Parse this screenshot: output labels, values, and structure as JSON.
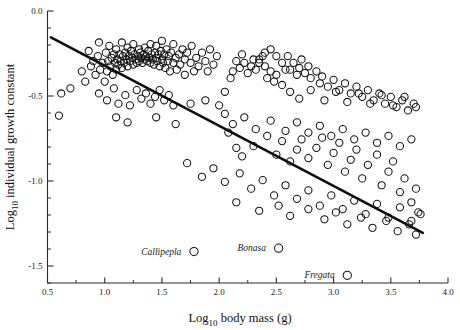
{
  "chart_data": {
    "type": "scatter",
    "title": "",
    "xlabel": "Log10 body mass (g)",
    "xlabel_main": "Log",
    "xlabel_sub": "10",
    "xlabel_rest": " body mass (g)",
    "ylabel": "Log10 individual growth constant",
    "ylabel_main": "Log",
    "ylabel_sub": "10",
    "ylabel_rest": " individual growth constant",
    "xlim": [
      0.5,
      4.0
    ],
    "ylim": [
      -1.6,
      0.0
    ],
    "grid": false,
    "legend": "none",
    "xticks": [
      0.5,
      1.0,
      1.5,
      2.0,
      2.5,
      3.0,
      3.5,
      4.0
    ],
    "xtick_labels": [
      "0.5",
      "1.0",
      "1.5",
      "2.0",
      "2.5",
      "3.0",
      "3.5",
      "4.0"
    ],
    "xminor_step": 0.25,
    "yticks": [
      0.0,
      -0.5,
      -1.0,
      -1.5
    ],
    "ytick_labels": [
      "0.0",
      "-0.5",
      "-1.0",
      "-1.5"
    ],
    "yminor_step": 0.1,
    "marker": "open-circle",
    "marker_radius_px": 3.6,
    "point_color": "#131313",
    "line_color": "#0d0d0d",
    "regression_line": {
      "x_start": 0.53,
      "y_start": -0.155,
      "x_end": 3.78,
      "y_end": -1.305,
      "slope": -0.354,
      "intercept": 0.033
    },
    "annotations": [
      {
        "label": "Callipepla",
        "x": 1.78,
        "y": -1.415,
        "label_dx_px": -6,
        "label_dy_px": 3
      },
      {
        "label": "Bonasa",
        "x": 2.52,
        "y": -1.395,
        "label_dx_px": -6,
        "label_dy_px": 3
      },
      {
        "label": "Fregata",
        "x": 3.12,
        "y": -1.555,
        "label_dx_px": -6,
        "label_dy_px": 3
      }
    ],
    "points": [
      [
        0.6,
        -0.615
      ],
      [
        0.62,
        -0.485
      ],
      [
        0.7,
        -0.455
      ],
      [
        0.8,
        -0.355
      ],
      [
        0.83,
        -0.415
      ],
      [
        0.86,
        -0.235
      ],
      [
        0.88,
        -0.325
      ],
      [
        0.9,
        -0.295
      ],
      [
        0.92,
        -0.375
      ],
      [
        0.94,
        -0.265
      ],
      [
        0.95,
        -0.185
      ],
      [
        0.96,
        -0.345
      ],
      [
        0.98,
        -0.305
      ],
      [
        1.0,
        -0.415
      ],
      [
        1.01,
        -0.245
      ],
      [
        1.02,
        -0.355
      ],
      [
        1.03,
        -0.295
      ],
      [
        1.04,
        -0.205
      ],
      [
        1.05,
        -0.325
      ],
      [
        1.06,
        -0.275
      ],
      [
        1.07,
        -0.375
      ],
      [
        1.08,
        -0.255
      ],
      [
        1.09,
        -0.305
      ],
      [
        1.1,
        -0.225
      ],
      [
        1.1,
        -0.345
      ],
      [
        1.11,
        -0.285
      ],
      [
        1.12,
        -0.315
      ],
      [
        1.13,
        -0.255
      ],
      [
        1.14,
        -0.295
      ],
      [
        1.15,
        -0.335
      ],
      [
        1.15,
        -0.185
      ],
      [
        1.16,
        -0.265
      ],
      [
        1.17,
        -0.305
      ],
      [
        1.18,
        -0.245
      ],
      [
        1.19,
        -0.285
      ],
      [
        1.2,
        -0.325
      ],
      [
        1.2,
        -0.215
      ],
      [
        1.21,
        -0.265
      ],
      [
        1.22,
        -0.295
      ],
      [
        1.23,
        -0.235
      ],
      [
        1.24,
        -0.275
      ],
      [
        1.25,
        -0.315
      ],
      [
        1.25,
        -0.195
      ],
      [
        1.26,
        -0.255
      ],
      [
        1.27,
        -0.285
      ],
      [
        1.28,
        -0.305
      ],
      [
        1.29,
        -0.265
      ],
      [
        1.3,
        -0.225
      ],
      [
        1.3,
        -0.295
      ],
      [
        1.31,
        -0.245
      ],
      [
        1.32,
        -0.275
      ],
      [
        1.33,
        -0.305
      ],
      [
        1.34,
        -0.255
      ],
      [
        1.35,
        -0.285
      ],
      [
        1.35,
        -0.215
      ],
      [
        1.36,
        -0.265
      ],
      [
        1.37,
        -0.295
      ],
      [
        1.38,
        -0.235
      ],
      [
        1.39,
        -0.275
      ],
      [
        1.4,
        -0.305
      ],
      [
        1.4,
        -0.195
      ],
      [
        1.41,
        -0.255
      ],
      [
        1.42,
        -0.285
      ],
      [
        1.43,
        -0.315
      ],
      [
        1.44,
        -0.245
      ],
      [
        1.45,
        -0.275
      ],
      [
        1.45,
        -0.205
      ],
      [
        1.46,
        -0.295
      ],
      [
        1.47,
        -0.255
      ],
      [
        1.48,
        -0.325
      ],
      [
        1.49,
        -0.235
      ],
      [
        1.5,
        -0.285
      ],
      [
        1.5,
        -0.175
      ],
      [
        1.51,
        -0.305
      ],
      [
        1.52,
        -0.255
      ],
      [
        1.53,
        -0.335
      ],
      [
        1.54,
        -0.225
      ],
      [
        1.55,
        -0.295
      ],
      [
        1.56,
        -0.265
      ],
      [
        1.57,
        -0.355
      ],
      [
        1.58,
        -0.245
      ],
      [
        1.6,
        -0.305
      ],
      [
        1.6,
        -0.195
      ],
      [
        1.62,
        -0.275
      ],
      [
        1.63,
        -0.345
      ],
      [
        1.65,
        -0.255
      ],
      [
        1.66,
        -0.315
      ],
      [
        1.68,
        -0.225
      ],
      [
        1.7,
        -0.285
      ],
      [
        1.7,
        -0.375
      ],
      [
        1.72,
        -0.245
      ],
      [
        1.75,
        -0.305
      ],
      [
        1.76,
        -0.205
      ],
      [
        1.78,
        -0.355
      ],
      [
        1.8,
        -0.275
      ],
      [
        1.82,
        -0.325
      ],
      [
        1.85,
        -0.245
      ],
      [
        1.88,
        -0.295
      ],
      [
        1.9,
        -0.355
      ],
      [
        1.92,
        -0.225
      ],
      [
        1.95,
        -0.315
      ],
      [
        1.98,
        -0.265
      ],
      [
        0.95,
        -0.485
      ],
      [
        1.02,
        -0.525
      ],
      [
        1.08,
        -0.455
      ],
      [
        1.12,
        -0.545
      ],
      [
        1.18,
        -0.495
      ],
      [
        1.22,
        -0.555
      ],
      [
        1.28,
        -0.465
      ],
      [
        1.32,
        -0.515
      ],
      [
        1.36,
        -0.485
      ],
      [
        1.4,
        -0.545
      ],
      [
        1.44,
        -0.505
      ],
      [
        1.48,
        -0.465
      ],
      [
        1.52,
        -0.525
      ],
      [
        1.56,
        -0.495
      ],
      [
        1.6,
        -0.555
      ],
      [
        1.1,
        -0.625
      ],
      [
        1.2,
        -0.655
      ],
      [
        1.45,
        -0.625
      ],
      [
        1.62,
        -0.665
      ],
      [
        1.75,
        -0.545
      ],
      [
        1.88,
        -0.525
      ],
      [
        2.0,
        -0.555
      ],
      [
        2.05,
        -0.475
      ],
      [
        2.1,
        -0.395
      ],
      [
        2.12,
        -0.355
      ],
      [
        2.15,
        -0.295
      ],
      [
        2.18,
        -0.335
      ],
      [
        2.2,
        -0.255
      ],
      [
        2.22,
        -0.305
      ],
      [
        2.25,
        -0.365
      ],
      [
        2.28,
        -0.325
      ],
      [
        2.3,
        -0.285
      ],
      [
        2.32,
        -0.345
      ],
      [
        2.35,
        -0.305
      ],
      [
        2.38,
        -0.265
      ],
      [
        2.4,
        -0.325
      ],
      [
        2.42,
        -0.395
      ],
      [
        2.45,
        -0.355
      ],
      [
        2.48,
        -0.415
      ],
      [
        2.5,
        -0.375
      ],
      [
        2.55,
        -0.435
      ],
      [
        2.58,
        -0.345
      ],
      [
        2.35,
        -0.285
      ],
      [
        2.4,
        -0.245
      ],
      [
        2.45,
        -0.225
      ],
      [
        2.5,
        -0.265
      ],
      [
        2.55,
        -0.305
      ],
      [
        2.6,
        -0.265
      ],
      [
        2.62,
        -0.345
      ],
      [
        2.65,
        -0.305
      ],
      [
        2.68,
        -0.375
      ],
      [
        2.7,
        -0.335
      ],
      [
        2.72,
        -0.285
      ],
      [
        2.75,
        -0.365
      ],
      [
        2.78,
        -0.325
      ],
      [
        2.8,
        -0.395
      ],
      [
        2.85,
        -0.355
      ],
      [
        2.88,
        -0.425
      ],
      [
        2.9,
        -0.385
      ],
      [
        2.95,
        -0.445
      ],
      [
        3.0,
        -0.405
      ],
      [
        3.05,
        -0.465
      ],
      [
        3.1,
        -0.425
      ],
      [
        3.15,
        -0.485
      ],
      [
        3.2,
        -0.445
      ],
      [
        3.25,
        -0.505
      ],
      [
        3.3,
        -0.465
      ],
      [
        3.35,
        -0.525
      ],
      [
        3.4,
        -0.485
      ],
      [
        3.45,
        -0.545
      ],
      [
        3.5,
        -0.505
      ],
      [
        3.55,
        -0.565
      ],
      [
        3.6,
        -0.525
      ],
      [
        3.65,
        -0.585
      ],
      [
        3.7,
        -0.545
      ],
      [
        2.08,
        -0.715
      ],
      [
        2.15,
        -0.805
      ],
      [
        2.2,
        -0.855
      ],
      [
        2.3,
        -0.795
      ],
      [
        2.42,
        -0.735
      ],
      [
        2.5,
        -0.845
      ],
      [
        2.55,
        -0.765
      ],
      [
        2.62,
        -0.885
      ],
      [
        2.68,
        -0.815
      ],
      [
        2.72,
        -0.755
      ],
      [
        2.78,
        -0.865
      ],
      [
        2.85,
        -0.805
      ],
      [
        2.9,
        -0.745
      ],
      [
        2.95,
        -0.905
      ],
      [
        3.0,
        -0.835
      ],
      [
        3.05,
        -0.775
      ],
      [
        3.1,
        -0.945
      ],
      [
        3.15,
        -0.875
      ],
      [
        3.2,
        -0.815
      ],
      [
        3.25,
        -0.985
      ],
      [
        3.3,
        -0.905
      ],
      [
        3.38,
        -0.845
      ],
      [
        3.42,
        -1.025
      ],
      [
        3.48,
        -0.945
      ],
      [
        3.52,
        -0.885
      ],
      [
        3.58,
        -1.065
      ],
      [
        3.62,
        -0.985
      ],
      [
        3.68,
        -1.125
      ],
      [
        3.72,
        -1.045
      ],
      [
        3.76,
        -1.195
      ],
      [
        1.72,
        -0.895
      ],
      [
        1.85,
        -0.975
      ],
      [
        1.95,
        -0.925
      ],
      [
        2.05,
        -1.005
      ],
      [
        2.18,
        -0.955
      ],
      [
        2.28,
        -1.045
      ],
      [
        2.38,
        -0.995
      ],
      [
        2.48,
        -1.085
      ],
      [
        2.58,
        -1.025
      ],
      [
        2.68,
        -1.105
      ],
      [
        2.78,
        -1.055
      ],
      [
        2.88,
        -1.145
      ],
      [
        2.98,
        -1.085
      ],
      [
        3.08,
        -1.165
      ],
      [
        3.18,
        -1.115
      ],
      [
        3.28,
        -1.195
      ],
      [
        3.38,
        -1.135
      ],
      [
        3.48,
        -1.215
      ],
      [
        3.58,
        -1.155
      ],
      [
        3.68,
        -1.235
      ],
      [
        3.74,
        -1.185
      ],
      [
        2.15,
        -1.125
      ],
      [
        2.35,
        -1.175
      ],
      [
        2.52,
        -1.145
      ],
      [
        2.62,
        -1.205
      ],
      [
        2.78,
        -1.165
      ],
      [
        2.92,
        -1.225
      ],
      [
        3.02,
        -1.185
      ],
      [
        3.12,
        -1.255
      ],
      [
        3.24,
        -1.215
      ],
      [
        3.34,
        -1.275
      ],
      [
        3.46,
        -1.235
      ],
      [
        3.56,
        -1.295
      ],
      [
        3.66,
        -1.255
      ],
      [
        3.72,
        -1.315
      ],
      [
        2.05,
        -0.605
      ],
      [
        2.12,
        -0.665
      ],
      [
        2.22,
        -0.625
      ],
      [
        2.32,
        -0.695
      ],
      [
        2.45,
        -0.645
      ],
      [
        2.58,
        -0.705
      ],
      [
        2.68,
        -0.655
      ],
      [
        2.78,
        -0.715
      ],
      [
        2.88,
        -0.675
      ],
      [
        2.98,
        -0.735
      ],
      [
        3.08,
        -0.695
      ],
      [
        3.18,
        -0.755
      ],
      [
        3.28,
        -0.715
      ],
      [
        3.38,
        -0.775
      ],
      [
        3.48,
        -0.735
      ],
      [
        3.58,
        -0.795
      ],
      [
        3.68,
        -0.755
      ],
      [
        2.62,
        -0.475
      ],
      [
        2.7,
        -0.515
      ],
      [
        2.8,
        -0.465
      ],
      [
        2.92,
        -0.525
      ],
      [
        3.02,
        -0.475
      ],
      [
        3.12,
        -0.535
      ],
      [
        3.22,
        -0.485
      ],
      [
        3.32,
        -0.545
      ],
      [
        3.42,
        -0.495
      ],
      [
        3.52,
        -0.555
      ],
      [
        3.62,
        -0.505
      ],
      [
        3.72,
        -0.565
      ]
    ]
  }
}
